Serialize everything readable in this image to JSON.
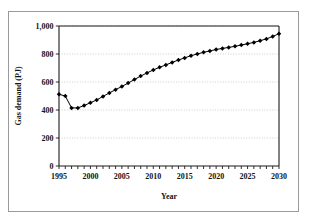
{
  "figure": {
    "caption_fragment": "",
    "frame_border_color": "#9a9a9a"
  },
  "chart_data": {
    "type": "line",
    "title": "",
    "subtitle": "",
    "xlabel": "Year",
    "ylabel": "Gas demand (PJ)",
    "xlim": [
      1995,
      2030
    ],
    "ylim": [
      0,
      1000
    ],
    "xticks": [
      1995,
      2000,
      2005,
      2010,
      2015,
      2020,
      2025,
      2030
    ],
    "xtick_labels": [
      "1995",
      "2000",
      "2005",
      "2010",
      "2015",
      "2020",
      "2025",
      "2030"
    ],
    "yticks": [
      0,
      200,
      400,
      600,
      800,
      1000
    ],
    "ytick_labels": [
      "0",
      "200",
      "400",
      "600",
      "800",
      "1,000"
    ],
    "minor_xtick_interval": 1,
    "grid": "horizontal-dotted",
    "legend": null,
    "marker": "diamond",
    "marker_color": "#000000",
    "line_color": "#000000",
    "x": [
      1995,
      1996,
      1997,
      1998,
      1999,
      2000,
      2001,
      2002,
      2003,
      2004,
      2005,
      2006,
      2007,
      2008,
      2009,
      2010,
      2011,
      2012,
      2013,
      2014,
      2015,
      2016,
      2017,
      2018,
      2019,
      2020,
      2021,
      2022,
      2023,
      2024,
      2025,
      2026,
      2027,
      2028,
      2029,
      2030
    ],
    "values": [
      512,
      500,
      415,
      415,
      432,
      452,
      472,
      497,
      522,
      545,
      568,
      592,
      618,
      642,
      665,
      686,
      705,
      722,
      740,
      757,
      772,
      788,
      800,
      812,
      822,
      832,
      840,
      847,
      855,
      864,
      873,
      883,
      895,
      908,
      925,
      945
    ],
    "series": [
      {
        "name": "Gas demand (PJ)",
        "values": [
          512,
          500,
          415,
          415,
          432,
          452,
          472,
          497,
          522,
          545,
          568,
          592,
          618,
          642,
          665,
          686,
          705,
          722,
          740,
          757,
          772,
          788,
          800,
          812,
          822,
          832,
          840,
          847,
          855,
          864,
          873,
          883,
          895,
          908,
          925,
          945
        ]
      }
    ]
  }
}
